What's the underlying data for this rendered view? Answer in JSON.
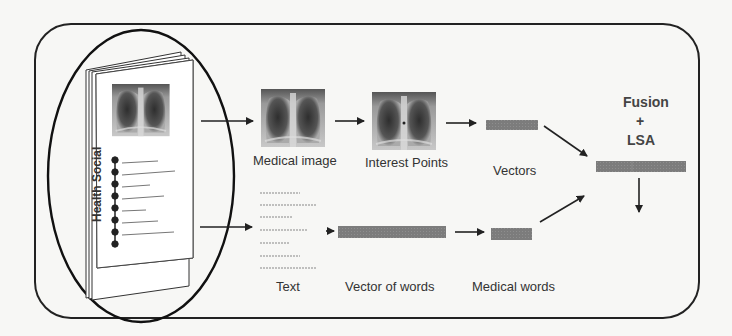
{
  "diagram": {
    "document_label": "Health Social",
    "nodes": {
      "medical_image": "Medical image",
      "interest_points": "Interest Points",
      "vectors": "Vectors",
      "text": "Text",
      "vector_of_words": "Vector of words",
      "medical_words": "Medical words",
      "fusion_line1": "Fusion",
      "fusion_plus": "+",
      "fusion_line2": "LSA"
    },
    "edges": [
      {
        "from": "Health Social",
        "to": "Medical image"
      },
      {
        "from": "Medical image",
        "to": "Interest Points"
      },
      {
        "from": "Interest Points",
        "to": "Vectors"
      },
      {
        "from": "Vectors",
        "to": "Fusion + LSA"
      },
      {
        "from": "Health Social",
        "to": "Text"
      },
      {
        "from": "Text",
        "to": "Vector of words"
      },
      {
        "from": "Vector of words",
        "to": "Medical words"
      },
      {
        "from": "Medical words",
        "to": "Fusion + LSA"
      },
      {
        "from": "Fusion + LSA",
        "to": "output"
      }
    ]
  },
  "colors": {
    "stroke": "#222222",
    "vector_fill": "#7a7a7a",
    "xray_dark": "#3a3a3a",
    "xray_light": "#bdbdbd"
  }
}
